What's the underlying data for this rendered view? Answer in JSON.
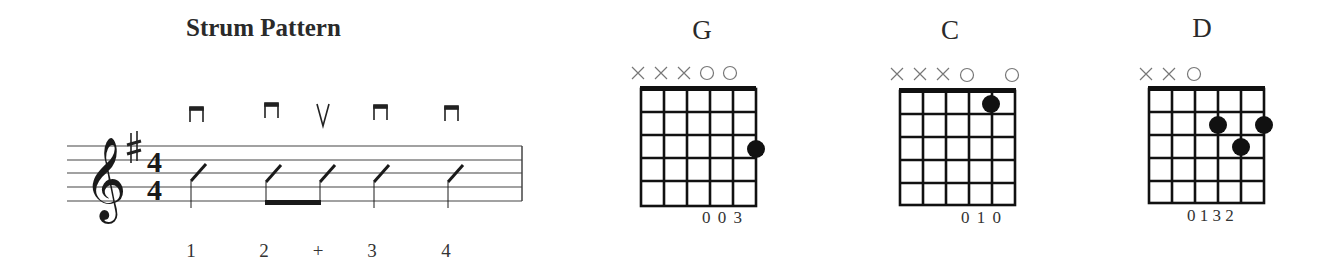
{
  "strum": {
    "title": "Strum Pattern",
    "key_signature": "♯",
    "time_signature": {
      "top": "4",
      "bottom": "4"
    },
    "strokes": [
      {
        "symbol": "down",
        "count": "1"
      },
      {
        "symbol": "down",
        "count": "2"
      },
      {
        "symbol": "up",
        "count": "+"
      },
      {
        "symbol": "down",
        "count": "3"
      },
      {
        "symbol": "down",
        "count": "4"
      }
    ],
    "counts": [
      "1",
      "2",
      "+",
      "3",
      "4"
    ]
  },
  "chords": [
    {
      "name": "G",
      "string_markers": [
        "x",
        "x",
        "x",
        "o",
        "o",
        ""
      ],
      "dots": [
        {
          "string": 6,
          "fret": 3
        }
      ],
      "fingering": "0 0 3",
      "colors": {
        "grid": "#111111",
        "dot": "#111111",
        "marker": "#777777"
      }
    },
    {
      "name": "C",
      "string_markers": [
        "x",
        "x",
        "x",
        "o",
        "",
        "o"
      ],
      "dots": [
        {
          "string": 5,
          "fret": 1
        }
      ],
      "fingering": "0 1 0"
    },
    {
      "name": "D",
      "string_markers": [
        "x",
        "x",
        "o",
        "",
        "",
        ""
      ],
      "dots": [
        {
          "string": 4,
          "fret": 2
        },
        {
          "string": 6,
          "fret": 2
        },
        {
          "string": 5,
          "fret": 3
        }
      ],
      "fingering": "0 1 3 2"
    }
  ]
}
